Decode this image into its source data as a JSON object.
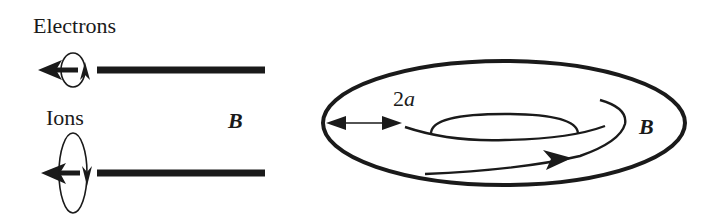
{
  "left_panel": {
    "electrons_label": "Electrons",
    "ions_label": "Ions",
    "field_label": "B"
  },
  "torus_panel": {
    "width_label_num": "2",
    "width_label_var": "a",
    "field_label": "B"
  },
  "colors": {
    "ink": "#1a1a1a",
    "background": "#ffffff"
  }
}
